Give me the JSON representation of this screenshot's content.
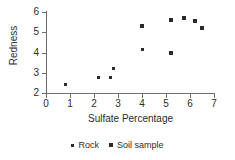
{
  "chart_data": {
    "type": "scatter",
    "title": "",
    "xlabel": "Sulfate Percentage",
    "ylabel": "Redness",
    "xlim": [
      0,
      7
    ],
    "ylim": [
      2,
      6
    ],
    "xticks": [
      0,
      1,
      2,
      3,
      4,
      5,
      6,
      7
    ],
    "yticks": [
      2,
      3,
      4,
      5,
      6
    ],
    "grid": false,
    "legend_position": "bottom-center",
    "marker_color": "#2a2a2a",
    "axis_color": "#6f6f6f",
    "series": [
      {
        "name": "Rock",
        "marker": "small-square",
        "points": [
          {
            "x": 0.8,
            "y": 2.4
          },
          {
            "x": 2.2,
            "y": 2.75
          },
          {
            "x": 2.7,
            "y": 2.75
          },
          {
            "x": 2.8,
            "y": 3.2
          },
          {
            "x": 4.0,
            "y": 4.15
          }
        ]
      },
      {
        "name": "Soil sample",
        "marker": "square",
        "points": [
          {
            "x": 4.0,
            "y": 5.3
          },
          {
            "x": 5.2,
            "y": 4.0
          },
          {
            "x": 5.2,
            "y": 5.6
          },
          {
            "x": 5.75,
            "y": 5.68
          },
          {
            "x": 6.2,
            "y": 5.55
          },
          {
            "x": 6.5,
            "y": 5.2
          }
        ]
      }
    ],
    "legend": [
      {
        "label": "Rock",
        "marker": "small-square"
      },
      {
        "label": "Soil sample",
        "marker": "square"
      }
    ]
  }
}
